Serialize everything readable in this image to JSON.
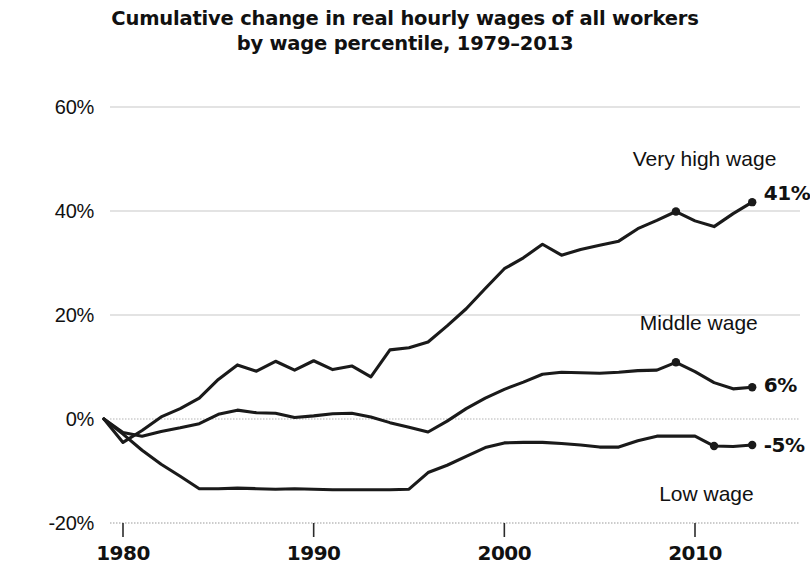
{
  "chart_data": {
    "type": "line",
    "title": "Cumulative change in real hourly wages of all workers by wage percentile, 1979–2013",
    "title_line1": "Cumulative change in real hourly wages of all workers",
    "title_line2": "by wage percentile, 1979–2013",
    "xlabel": "",
    "ylabel": "",
    "xlim": [
      1979,
      2013
    ],
    "ylim": [
      -20,
      60
    ],
    "grid": true,
    "grid_axis": "y",
    "legend_position": "inline-right",
    "y_ticks": [
      60,
      40,
      20,
      0,
      -20
    ],
    "y_tick_labels": [
      "60%",
      "40%",
      "20%",
      "0%",
      "-20%"
    ],
    "x_ticks": [
      1980,
      1990,
      2000,
      2010
    ],
    "x_tick_labels": [
      "1980",
      "1990",
      "2000",
      "2010"
    ],
    "x": [
      1979,
      1980,
      1981,
      1982,
      1983,
      1984,
      1985,
      1986,
      1987,
      1988,
      1989,
      1990,
      1991,
      1992,
      1993,
      1994,
      1995,
      1996,
      1997,
      1998,
      1999,
      2000,
      2001,
      2002,
      2003,
      2004,
      2005,
      2006,
      2007,
      2008,
      2009,
      2010,
      2011,
      2012,
      2013
    ],
    "series": [
      {
        "name": "Very high wage",
        "label": "Very high wage",
        "end_value_label": "41%",
        "color": "#1a1a1a",
        "values": [
          0,
          -4.5,
          -2.2,
          0.4,
          2.0,
          4.0,
          7.6,
          10.4,
          9.2,
          11.1,
          9.4,
          11.2,
          9.5,
          10.2,
          8.1,
          13.3,
          13.7,
          14.8,
          17.9,
          21.2,
          25.1,
          28.9,
          31.0,
          33.6,
          31.5,
          32.6,
          33.4,
          34.2,
          36.6,
          38.2,
          39.9,
          38.1,
          37.0,
          39.5,
          41.7
        ]
      },
      {
        "name": "Middle wage",
        "label": "Middle wage",
        "end_value_label": "6%",
        "color": "#1a1a1a",
        "values": [
          0,
          -2.6,
          -3.3,
          -2.4,
          -1.7,
          -0.9,
          0.9,
          1.7,
          1.2,
          1.1,
          0.3,
          0.6,
          1.0,
          1.1,
          0.4,
          -0.7,
          -1.6,
          -2.5,
          -0.4,
          2.0,
          4.0,
          5.7,
          7.1,
          8.6,
          9.0,
          8.9,
          8.8,
          9.0,
          9.3,
          9.4,
          10.9,
          9.1,
          7.0,
          5.8,
          6.1
        ]
      },
      {
        "name": "Low wage",
        "label": "Low wage",
        "end_value_label": "-5%",
        "color": "#1a1a1a",
        "values": [
          0,
          -2.9,
          -6.0,
          -8.7,
          -11.0,
          -13.4,
          -13.4,
          -13.3,
          -13.4,
          -13.5,
          -13.4,
          -13.5,
          -13.6,
          -13.6,
          -13.6,
          -13.6,
          -13.5,
          -10.3,
          -8.9,
          -7.2,
          -5.5,
          -4.6,
          -4.5,
          -4.5,
          -4.7,
          -5.0,
          -5.4,
          -5.4,
          -4.2,
          -3.3,
          -3.3,
          -3.3,
          -5.2,
          -5.3,
          -5.0
        ]
      }
    ],
    "markers": [
      {
        "series": "Very high wage",
        "x": 2009,
        "y": 39.9
      },
      {
        "series": "Very high wage",
        "x": 2013,
        "y": 41.7
      },
      {
        "series": "Middle wage",
        "x": 2009,
        "y": 10.9
      },
      {
        "series": "Middle wage",
        "x": 2013,
        "y": 6.1
      },
      {
        "series": "Low wage",
        "x": 2011,
        "y": -5.2
      },
      {
        "series": "Low wage",
        "x": 2013,
        "y": -5.0
      }
    ],
    "annotations": [
      {
        "text": "Very high wage",
        "x": 2010.5,
        "y": 50.0,
        "anchor": "middle"
      },
      {
        "text": "41%",
        "x": 2013.6,
        "y": 43.5,
        "anchor": "start"
      },
      {
        "text": "Middle wage",
        "x": 2010.2,
        "y": 18.5,
        "anchor": "middle"
      },
      {
        "text": "6%",
        "x": 2013.6,
        "y": 6.5,
        "anchor": "start"
      },
      {
        "text": "-5%",
        "x": 2013.6,
        "y": -5.0,
        "anchor": "start"
      },
      {
        "text": "Low wage",
        "x": 2010.6,
        "y": -14.5,
        "anchor": "middle"
      }
    ],
    "axis_colors": {
      "gridline": "#c8c8c8",
      "zero_line": "#b4b4b4",
      "baseline": "#bcbcbc",
      "line": "#1a1a1a"
    }
  }
}
